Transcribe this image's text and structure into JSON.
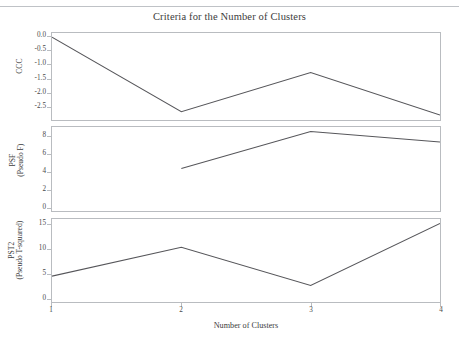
{
  "figure": {
    "title": "Criteria for the Number of Clusters",
    "footnote": ""
  },
  "chart_data": [
    {
      "type": "line",
      "panel": "ccc",
      "title": "Criteria for the Number of Clusters",
      "xlabel": "Number of Clusters",
      "ylabel": "CCC",
      "ylabel_lines": [
        "CCC"
      ],
      "x": [
        1,
        2,
        3,
        4
      ],
      "values": [
        0.0,
        -2.7,
        -1.28,
        -2.82
      ],
      "xticks": [
        1,
        2,
        3,
        4
      ],
      "xticklabels": [
        "1",
        "2",
        "3",
        "4"
      ],
      "yticks": [
        0.0,
        -0.5,
        -1.0,
        -1.5,
        -2.0,
        -2.5
      ],
      "yticklabels": [
        "0.0",
        "-0.5",
        "-1.0",
        "-1.5",
        "-2.0",
        "-2.5"
      ],
      "xlim": [
        1,
        4
      ],
      "ylim": [
        -3.0,
        0.15
      ],
      "grid": false,
      "legend": "none",
      "line_color": "#56565a"
    },
    {
      "type": "line",
      "panel": "psf",
      "xlabel": "Number of Clusters",
      "ylabel": "PSF (Pseudo F)",
      "ylabel_lines": [
        "PSF",
        "(Pseudo F)"
      ],
      "x": [
        2,
        3,
        4
      ],
      "values": [
        4.4,
        8.6,
        7.4
      ],
      "xticks": [
        1,
        2,
        3,
        4
      ],
      "xticklabels": [
        "1",
        "2",
        "3",
        "4"
      ],
      "yticks": [
        0,
        2,
        4,
        6,
        8
      ],
      "yticklabels": [
        "0",
        "2",
        "4",
        "6",
        "8"
      ],
      "xlim": [
        1,
        4
      ],
      "ylim": [
        -0.4,
        9.1
      ],
      "grid": false,
      "legend": "none",
      "line_color": "#56565a"
    },
    {
      "type": "line",
      "panel": "pst2",
      "xlabel": "Number of Clusters",
      "ylabel": "PST2 (Pseudo T-squared)",
      "ylabel_lines": [
        "PST2",
        "(Pseudo T-squared)"
      ],
      "x": [
        1,
        2,
        3,
        4
      ],
      "values": [
        4.5,
        10.4,
        2.6,
        15.3
      ],
      "xticks": [
        1,
        2,
        3,
        4
      ],
      "xticklabels": [
        "1",
        "2",
        "3",
        "4"
      ],
      "yticks": [
        0,
        5,
        10,
        15
      ],
      "yticklabels": [
        "0",
        "5",
        "10",
        "15"
      ],
      "xlim": [
        1,
        4
      ],
      "ylim": [
        -0.8,
        16.2
      ],
      "grid": false,
      "legend": "none",
      "line_color": "#56565a"
    }
  ],
  "axes": {
    "x_title": "Number of Clusters",
    "x_tick_labels": [
      "1",
      "2",
      "3",
      "4"
    ],
    "ccc": {
      "label_lines": [
        "CCC"
      ],
      "tick_labels": [
        "0.0",
        "-0.5",
        "-1.0",
        "-1.5",
        "-2.0",
        "-2.5"
      ]
    },
    "psf": {
      "label_lines": [
        "PSF",
        "(Pseudo F)"
      ],
      "tick_labels": [
        "8",
        "6",
        "4",
        "2",
        "0"
      ]
    },
    "pst2": {
      "label_lines": [
        "PST2",
        "(Pseudo T-squared)"
      ],
      "tick_labels": [
        "15",
        "10",
        "5",
        "0"
      ]
    }
  }
}
